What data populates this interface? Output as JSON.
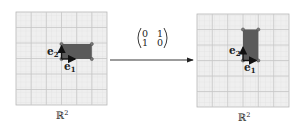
{
  "diagram": {
    "left_plane": {
      "label": "ℝ",
      "label_sup": "2",
      "rect": {
        "width_units": 2,
        "height_units": 1
      },
      "vectors": [
        {
          "name": "e",
          "sub": "1",
          "direction": "right"
        },
        {
          "name": "e",
          "sub": "2",
          "direction": "up"
        }
      ]
    },
    "transform": {
      "matrix": [
        [
          "0",
          "1"
        ],
        [
          "1",
          "0"
        ]
      ],
      "arrow_direction": "right"
    },
    "right_plane": {
      "label": "ℝ",
      "label_sup": "2",
      "rect": {
        "width_units": 1,
        "height_units": 2
      },
      "vectors": [
        {
          "name": "e",
          "sub": "1",
          "direction": "right"
        },
        {
          "name": "e",
          "sub": "2",
          "direction": "up"
        }
      ]
    },
    "colors": {
      "grid_bg": "#efefef",
      "grid_minor": "#d9d9d9",
      "grid_major": "#c4c4c4",
      "rect_fill": "#5a5a5a",
      "vector": "#111111"
    }
  }
}
